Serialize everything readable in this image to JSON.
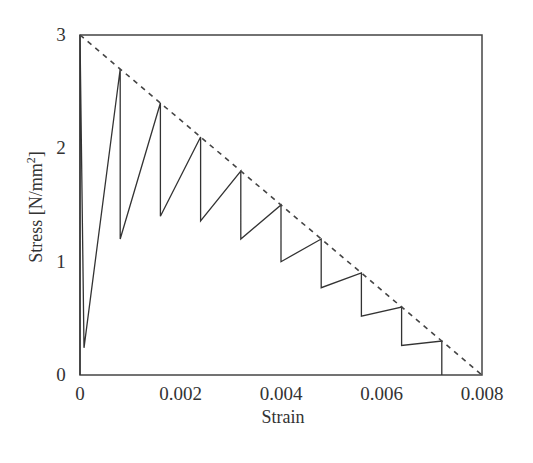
{
  "chart_data": {
    "type": "line",
    "title": "",
    "xlabel": "Strain",
    "ylabel": "Stress [N/mm²]",
    "ylabel_parts": {
      "main": "Stress  [N/mm",
      "sup": "2",
      "end": "]"
    },
    "xlim": [
      0,
      0.008
    ],
    "ylim": [
      0,
      3
    ],
    "xticks": [
      0,
      0.002,
      0.004,
      0.006,
      0.008
    ],
    "xtick_labels": [
      "0",
      "0.002",
      "0.004",
      "0.006",
      "0.008"
    ],
    "yticks": [
      0,
      1,
      2,
      3
    ],
    "ytick_labels": [
      "0",
      "1",
      "2",
      "3"
    ],
    "grid": false,
    "legend": null,
    "series": [
      {
        "name": "stress-strain response",
        "style": "solid",
        "color": "#333333",
        "x": [
          0,
          0,
          8e-05,
          0.0008,
          0.0008,
          0.0016,
          0.0016,
          0.0024,
          0.0024,
          0.0032,
          0.0032,
          0.004,
          0.004,
          0.0048,
          0.0048,
          0.0056,
          0.0056,
          0.0064,
          0.0064,
          0.0072,
          0.0072
        ],
        "y": [
          0,
          3.0,
          0.24,
          2.7,
          1.2,
          2.4,
          1.4,
          2.1,
          1.36,
          1.8,
          1.2,
          1.5,
          1.0,
          1.2,
          0.77,
          0.9,
          0.52,
          0.6,
          0.26,
          0.3,
          0
        ]
      },
      {
        "name": "envelope",
        "style": "dashed",
        "color": "#444444",
        "x": [
          0,
          0.008
        ],
        "y": [
          3.0,
          0
        ]
      }
    ]
  }
}
